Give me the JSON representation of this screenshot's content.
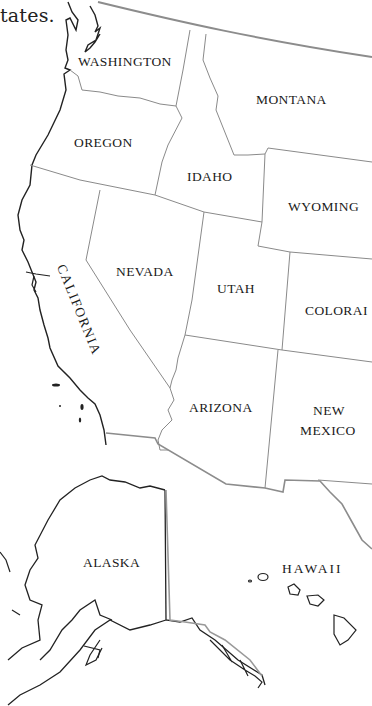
{
  "caption": "tates.",
  "states": [
    {
      "name": "WASHINGTON",
      "x": 78,
      "y": 54
    },
    {
      "name": "MONTANA",
      "x": 256,
      "y": 92
    },
    {
      "name": "OREGON",
      "x": 74,
      "y": 135
    },
    {
      "name": "IDAHO",
      "x": 187,
      "y": 169
    },
    {
      "name": "WYOMING",
      "x": 288,
      "y": 199
    },
    {
      "name": "NEVADA",
      "x": 116,
      "y": 264
    },
    {
      "name": "UTAH",
      "x": 217,
      "y": 281
    },
    {
      "name": "COLORAI",
      "x": 305,
      "y": 303
    },
    {
      "name": "CALIFORNIA",
      "x": 68,
      "y": 262,
      "rotated": true
    },
    {
      "name": "ARIZONA",
      "x": 189,
      "y": 400
    },
    {
      "name": "NEW",
      "x": 313,
      "y": 403
    },
    {
      "name": "MEXICO",
      "x": 300,
      "y": 423
    },
    {
      "name": "ALASKA",
      "x": 83,
      "y": 555
    },
    {
      "name": "HAWAII",
      "x": 282,
      "y": 561
    }
  ],
  "colors": {
    "coast": "#222222",
    "state_border": "#8a8a8a",
    "intl_border": "#8c8c8c"
  }
}
